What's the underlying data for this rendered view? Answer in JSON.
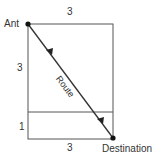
{
  "diagram": {
    "start_label": "Ant",
    "end_label": "Destination",
    "route_label": "Route",
    "top_width": "3",
    "bottom_width": "3",
    "upper_height": "3",
    "lower_height": "1",
    "line_color": "#444444"
  }
}
